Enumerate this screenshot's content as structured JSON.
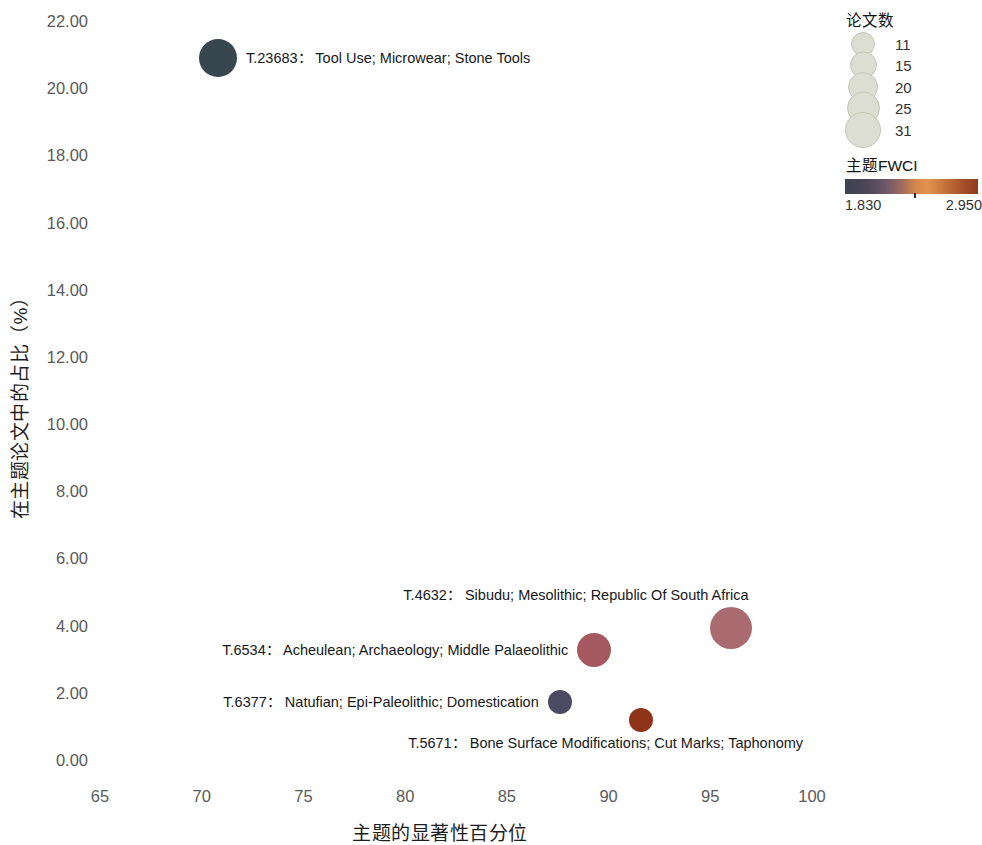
{
  "chart_data": {
    "type": "scatter",
    "title": "",
    "xlabel": "主题的显著性百分位",
    "ylabel": "在主题论文中的占比（%）",
    "xlim": [
      63.2,
      101.5
    ],
    "ylim": [
      -0.6,
      22.4
    ],
    "xticks": [
      65,
      70,
      75,
      80,
      85,
      90,
      95,
      100
    ],
    "xtick_labels": [
      "65",
      "70",
      "75",
      "80",
      "85",
      "90",
      "95",
      "100"
    ],
    "yticks": [
      0,
      2,
      4,
      6,
      8,
      10,
      12,
      14,
      16,
      18,
      20,
      22
    ],
    "ytick_labels": [
      "0.00",
      "2.00",
      "4.00",
      "6.00",
      "8.00",
      "10.00",
      "12.00",
      "14.00",
      "16.00",
      "18.00",
      "20.00",
      "22.00"
    ],
    "grid": false,
    "legend_position": "top-right",
    "size_encoding": "论文数",
    "color_encoding": "主题FWCI",
    "points": [
      {
        "id": "T.23683",
        "label": "T.23683： Tool Use; Microwear; Stone Tools",
        "keywords": "Tool Use; Microwear; Stone Tools",
        "x": 70.8,
        "y": 20.9,
        "radius_px": 19,
        "color": "#37464f",
        "label_side": "right"
      },
      {
        "id": "T.4632",
        "label": "T.4632： Sibudu; Mesolithic; Republic Of South Africa",
        "keywords": "Sibudu; Mesolithic; Republic Of South Africa",
        "x": 96.0,
        "y": 3.93,
        "radius_px": 21,
        "color": "#a96a70",
        "label_side": "above"
      },
      {
        "id": "T.6534",
        "label": "T.6534： Acheulean; Archaeology; Middle Palaeolithic",
        "keywords": "Acheulean; Archaeology; Middle Palaeolithic",
        "x": 89.3,
        "y": 3.26,
        "radius_px": 17,
        "color": "#a4585f",
        "label_side": "left"
      },
      {
        "id": "T.6377",
        "label": "T.6377： Natufian; Epi-Paleolithic; Domestication",
        "keywords": "Natufian; Epi-Paleolithic; Domestication",
        "x": 87.6,
        "y": 1.73,
        "radius_px": 12,
        "color": "#4c4a63",
        "label_side": "left"
      },
      {
        "id": "T.5671",
        "label": "T.5671： Bone Surface Modifications; Cut Marks; Taphonomy",
        "keywords": "Bone Surface Modifications; Cut Marks; Taphonomy",
        "x": 91.6,
        "y": 1.2,
        "radius_px": 12,
        "color": "#8f3319",
        "label_side": "below"
      }
    ]
  },
  "legend": {
    "size": {
      "title": "论文数",
      "entries": [
        {
          "value": "11",
          "radius_px": 11
        },
        {
          "value": "15",
          "radius_px": 12.5
        },
        {
          "value": "20",
          "radius_px": 14
        },
        {
          "value": "25",
          "radius_px": 15.5
        },
        {
          "value": "31",
          "radius_px": 17
        }
      ]
    },
    "color": {
      "title": "主题FWCI",
      "min": "1.830",
      "max": "2.950",
      "gradient_stops": [
        "#3a4450",
        "#6a5668",
        "#d8894a",
        "#8e3a1c"
      ]
    }
  }
}
